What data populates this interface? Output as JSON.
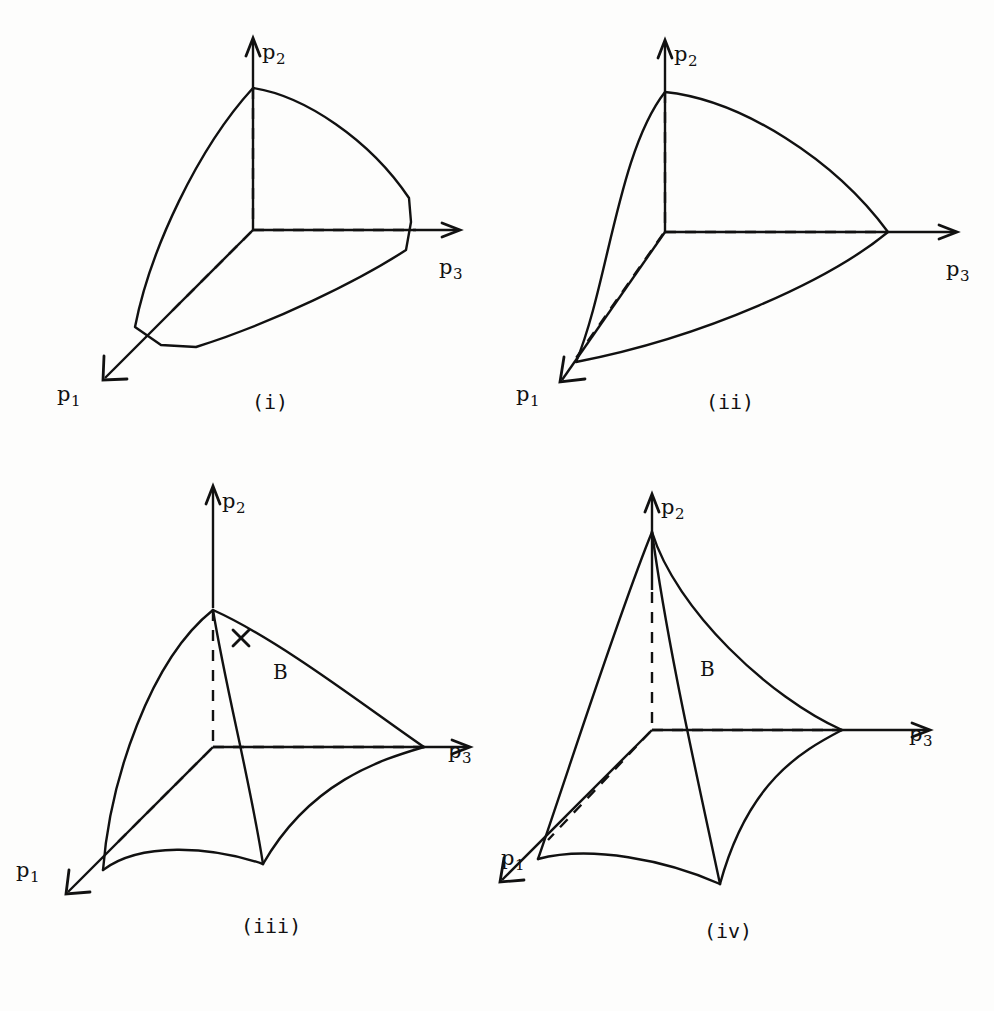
{
  "figure": {
    "background_color": "#fdfdfc",
    "ink_color": "#111111",
    "panel_count": 4
  },
  "panels": [
    {
      "id": "i",
      "caption": "(i)",
      "axes": [
        {
          "name": "p2",
          "label_text": "p",
          "label_sub": "2",
          "direction": "up"
        },
        {
          "name": "p3",
          "label_text": "p",
          "label_sub": "3",
          "direction": "right"
        },
        {
          "name": "p1",
          "label_text": "p",
          "label_sub": "1",
          "direction": "down-left"
        }
      ],
      "description": "Convex body with truncated (chamfered) corners at the p1 and p3 vertices; edges slightly convex.",
      "region_label": null,
      "has_cross_mark": false
    },
    {
      "id": "ii",
      "caption": "(ii)",
      "axes": [
        {
          "name": "p2",
          "label_text": "p",
          "label_sub": "2",
          "direction": "up"
        },
        {
          "name": "p3",
          "label_text": "p",
          "label_sub": "3",
          "direction": "right"
        },
        {
          "name": "p1",
          "label_text": "p",
          "label_sub": "1",
          "direction": "down-left"
        }
      ],
      "description": "Convex body with sharp vertices on all three axes and smoothly convex bulging edges.",
      "region_label": null,
      "has_cross_mark": false
    },
    {
      "id": "iii",
      "caption": "(iii)",
      "axes": [
        {
          "name": "p2",
          "label_text": "p",
          "label_sub": "2",
          "direction": "up"
        },
        {
          "name": "p3",
          "label_text": "p",
          "label_sub": "3",
          "direction": "right"
        },
        {
          "name": "p1",
          "label_text": "p",
          "label_sub": "1",
          "direction": "down-left"
        }
      ],
      "description": "Non-convex body with a re-entrant interior fold curve labelled B running from the p2 apex down to a cusp, marked with a cross.",
      "region_label": "B",
      "has_cross_mark": true
    },
    {
      "id": "iv",
      "caption": "(iv)",
      "axes": [
        {
          "name": "p2",
          "label_text": "p",
          "label_sub": "2",
          "direction": "up"
        },
        {
          "name": "p3",
          "label_text": "p",
          "label_sub": "3",
          "direction": "right"
        },
        {
          "name": "p1",
          "label_text": "p",
          "label_sub": "1",
          "direction": "down-left"
        }
      ],
      "description": "Non-convex body with a sharp cusp at the p2 apex and an interior fold curve labelled B descending to a lower cusp.",
      "region_label": "B",
      "has_cross_mark": false
    }
  ]
}
